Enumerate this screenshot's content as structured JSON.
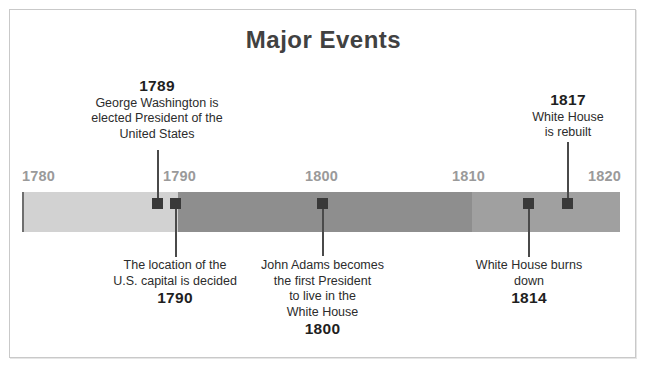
{
  "page": {
    "title": "Major Events"
  },
  "chart_data": {
    "type": "timeline",
    "title": "Major Events",
    "xlabel": "",
    "ylabel": "",
    "axis_range": [
      1780,
      1820
    ],
    "tick_labels": [
      "1780",
      "1790",
      "1800",
      "1810",
      "1820"
    ],
    "tick_values": [
      1780,
      1790,
      1800,
      1810,
      1820
    ],
    "grid": false,
    "legend": "none",
    "track_segments": [
      {
        "from": 1780,
        "to": 1790,
        "color": "#d2d2d2"
      },
      {
        "from": 1790,
        "to": 1810,
        "color": "#8e8e8e"
      },
      {
        "from": 1810,
        "to": 1820,
        "color": "#a0a0a0"
      }
    ],
    "events": [
      {
        "year": 1789,
        "year_label": "1789",
        "text": "George Washington is elected President of the United States",
        "lines": [
          "George Washington is",
          "elected President of the",
          "United States"
        ],
        "side": "above",
        "year_position": "top"
      },
      {
        "year": 1790,
        "year_label": "1790",
        "text": "The location of the U.S. capital is decided",
        "lines": [
          "The location of the",
          "U.S. capital is decided"
        ],
        "side": "below",
        "year_position": "bottom"
      },
      {
        "year": 1800,
        "year_label": "1800",
        "text": "John Adams becomes the first President to live in the White House",
        "lines": [
          "John Adams becomes",
          "the first President",
          "to live in the",
          "White House"
        ],
        "side": "below",
        "year_position": "bottom"
      },
      {
        "year": 1814,
        "year_label": "1814",
        "text": "White House burns down",
        "lines": [
          "White House burns",
          "down"
        ],
        "side": "below",
        "year_position": "bottom"
      },
      {
        "year": 1817,
        "year_label": "1817",
        "text": "White House is rebuilt",
        "lines": [
          "White House",
          "is rebuilt"
        ],
        "side": "above",
        "year_position": "top"
      }
    ]
  },
  "colors": {
    "title": "#414141",
    "tick_label": "#9a9a9a",
    "marker": "#393939",
    "leader": "#4a4a4a",
    "text": "#2c2c2c",
    "frame": "#c9c9c9",
    "background": "#ffffff"
  },
  "ticks": [
    {
      "label": "1780",
      "left": 22,
      "align": "left"
    },
    {
      "label": "1790",
      "left": 163,
      "align": "left"
    },
    {
      "label": "1800",
      "left": 305,
      "align": "left"
    },
    {
      "label": "1810",
      "left": 452,
      "align": "left"
    },
    {
      "label": "1820",
      "left": 588,
      "align": "left"
    }
  ],
  "segments": [
    {
      "name": "segment-1780-1790",
      "left": 0,
      "width": 156,
      "color": "#d2d2d2"
    },
    {
      "name": "segment-1790-1810",
      "left": 156,
      "width": 294,
      "color": "#8e8e8e"
    },
    {
      "name": "segment-1810-1820",
      "left": 450,
      "width": 148,
      "color": "#a0a0a0"
    }
  ],
  "markers": [
    {
      "name": "marker-1789",
      "left": 152
    },
    {
      "name": "marker-1790",
      "left": 170
    },
    {
      "name": "marker-1800",
      "left": 317
    },
    {
      "name": "marker-1814",
      "left": 523
    },
    {
      "name": "marker-1817",
      "left": 562
    }
  ],
  "leaders": [
    {
      "name": "leader-1789",
      "left": 157,
      "top": 150,
      "height": 52
    },
    {
      "name": "leader-1790",
      "left": 175,
      "top": 203,
      "height": 54
    },
    {
      "name": "leader-1800",
      "left": 322,
      "top": 203,
      "height": 53
    },
    {
      "name": "leader-1814",
      "left": 528,
      "top": 203,
      "height": 54
    },
    {
      "name": "leader-1817",
      "left": 567,
      "top": 142,
      "height": 60
    }
  ],
  "annotations": [
    {
      "name": "annotation-1789",
      "left": 59,
      "top": 78,
      "width": 196
    },
    {
      "name": "annotation-1790",
      "left": 92,
      "top": 258,
      "width": 166
    },
    {
      "name": "annotation-1800",
      "left": 250,
      "top": 258,
      "width": 145
    },
    {
      "name": "annotation-1814",
      "left": 458,
      "top": 258,
      "width": 142
    },
    {
      "name": "annotation-1817",
      "left": 497,
      "top": 92,
      "width": 142
    }
  ]
}
